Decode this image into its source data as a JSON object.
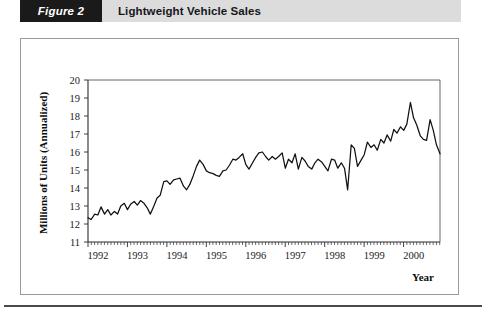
{
  "header": {
    "figure_tag": "Figure 2",
    "title": "Lightweight Vehicle Sales",
    "tag_bg": "#1a1a1a",
    "tag_color": "#ffffff",
    "band_bg": "#dcdcdc"
  },
  "chart_data": {
    "type": "line",
    "title": "Lightweight Vehicle Sales",
    "xlabel": "Year",
    "ylabel": "Millions of Units (Annualized)",
    "xlim": [
      1992.0,
      2000.92
    ],
    "ylim": [
      11,
      20
    ],
    "yticks": [
      11,
      12,
      13,
      14,
      15,
      16,
      17,
      18,
      19,
      20
    ],
    "xticks": [
      1992,
      1993,
      1994,
      1995,
      1996,
      1997,
      1998,
      1999,
      2000
    ],
    "xtick_labels": [
      "1992",
      "1993",
      "1994",
      "1995",
      "1996",
      "1997",
      "1998",
      "1999",
      "2000"
    ],
    "minor_tick_interval_years": 0.0833,
    "grid": false,
    "legend": null,
    "line_color": "#111111",
    "series": [
      {
        "name": "Lightweight Vehicle Sales",
        "x": [
          1992.0,
          1992.08,
          1992.17,
          1992.25,
          1992.33,
          1992.42,
          1992.5,
          1992.58,
          1992.67,
          1992.75,
          1992.83,
          1992.92,
          1993.0,
          1993.08,
          1993.17,
          1993.25,
          1993.33,
          1993.42,
          1993.5,
          1993.58,
          1993.67,
          1993.75,
          1993.83,
          1993.92,
          1994.0,
          1994.08,
          1994.17,
          1994.25,
          1994.33,
          1994.42,
          1994.5,
          1994.58,
          1994.67,
          1994.75,
          1994.83,
          1994.92,
          1995.0,
          1995.08,
          1995.17,
          1995.25,
          1995.33,
          1995.42,
          1995.5,
          1995.58,
          1995.67,
          1995.75,
          1995.83,
          1995.92,
          1996.0,
          1996.08,
          1996.17,
          1996.25,
          1996.33,
          1996.42,
          1996.5,
          1996.58,
          1996.67,
          1996.75,
          1996.83,
          1996.92,
          1997.0,
          1997.08,
          1997.17,
          1997.25,
          1997.33,
          1997.42,
          1997.5,
          1997.58,
          1997.67,
          1997.75,
          1997.83,
          1997.92,
          1998.0,
          1998.08,
          1998.17,
          1998.25,
          1998.33,
          1998.42,
          1998.5,
          1998.58,
          1998.67,
          1998.75,
          1998.83,
          1998.92,
          1999.0,
          1999.08,
          1999.17,
          1999.25,
          1999.33,
          1999.42,
          1999.5,
          1999.58,
          1999.67,
          1999.75,
          1999.83,
          1999.92,
          2000.0,
          2000.08,
          2000.17,
          2000.25,
          2000.33,
          2000.42,
          2000.5,
          2000.58,
          2000.67,
          2000.75,
          2000.83,
          2000.92
        ],
        "values": [
          12.35,
          12.25,
          12.55,
          12.5,
          12.95,
          12.55,
          12.8,
          12.5,
          12.7,
          12.55,
          13.0,
          13.15,
          12.8,
          13.1,
          13.25,
          13.05,
          13.3,
          13.15,
          12.9,
          12.55,
          13.0,
          13.45,
          13.6,
          14.35,
          14.4,
          14.2,
          14.45,
          14.5,
          14.55,
          14.1,
          13.9,
          14.2,
          14.7,
          15.2,
          15.55,
          15.3,
          14.95,
          14.85,
          14.8,
          14.7,
          14.65,
          14.95,
          15.0,
          15.25,
          15.6,
          15.55,
          15.7,
          15.9,
          15.3,
          15.05,
          15.4,
          15.7,
          15.95,
          16.0,
          15.75,
          15.55,
          15.75,
          15.6,
          15.75,
          15.95,
          15.1,
          15.6,
          15.4,
          15.9,
          15.05,
          15.7,
          15.5,
          15.2,
          15.05,
          15.4,
          15.6,
          15.45,
          15.2,
          14.95,
          15.6,
          15.55,
          15.1,
          15.4,
          15.1,
          13.9,
          16.4,
          16.2,
          15.2,
          15.55,
          15.85,
          16.55,
          16.25,
          16.4,
          16.1,
          16.7,
          16.5,
          16.95,
          16.6,
          17.25,
          17.05,
          17.4,
          17.2,
          17.55,
          18.75,
          17.9,
          17.5,
          16.9,
          16.7,
          16.65,
          17.8,
          17.2,
          16.4,
          15.9
        ]
      }
    ]
  },
  "axis": {
    "y_title": "Millions of Units (Annualized)",
    "x_title": "Year"
  }
}
